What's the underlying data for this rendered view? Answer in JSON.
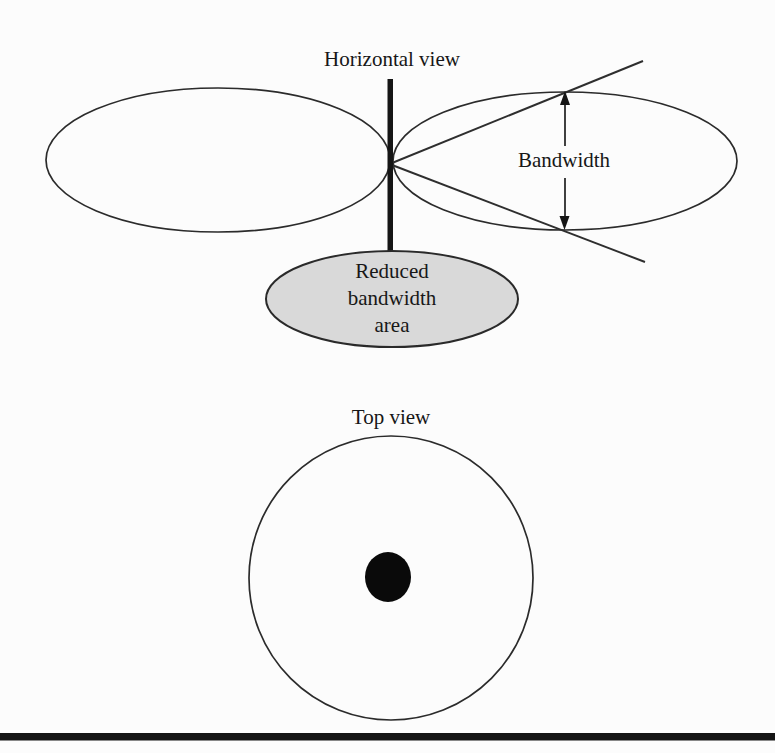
{
  "figure": {
    "background_color": "#fcfcfc",
    "ink_color": "#1f1f1f",
    "stroke_color": "#2b2b2b",
    "horizontal_view": {
      "title": "Horizontal view",
      "bandwidth_label": "Bandwidth",
      "reduced_area": {
        "fill_color": "#d9d9d9",
        "lines": [
          "Reduced",
          "bandwidth",
          "area"
        ]
      }
    },
    "top_view": {
      "title": "Top view",
      "dot_color": "#0a0a0a"
    }
  }
}
